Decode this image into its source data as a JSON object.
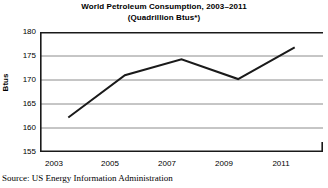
{
  "chart_data": {
    "type": "line",
    "title": "World Petroleum Consumption, 2003–2011",
    "subtitle": "(Quadrillion Btus*)",
    "xlabel": "",
    "ylabel": "Btus",
    "x": [
      2003,
      2005,
      2007,
      2009,
      2011
    ],
    "values": [
      162.2,
      171.0,
      174.3,
      170.2,
      176.8
    ],
    "xtick_labels": [
      "2003",
      "2005",
      "2007",
      "2009",
      "2011"
    ],
    "ytick_labels": [
      "155",
      "160",
      "165",
      "170",
      "175",
      "180"
    ],
    "yticks": [
      155,
      160,
      165,
      170,
      175,
      180
    ],
    "ylim": [
      155,
      180
    ],
    "xlim": [
      2002,
      2012
    ],
    "grid": true,
    "legend": null,
    "line_color": "#1a1a1a",
    "grid_color": "#8c8c8c",
    "axis_color": "#1a1a1a",
    "background": "#ffffff"
  },
  "source": {
    "text": "Source: US Energy Information Administration"
  }
}
